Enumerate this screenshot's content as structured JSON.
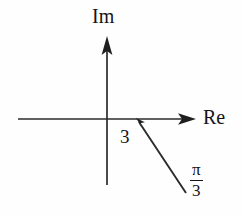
{
  "figure": {
    "kind": "complex-plane-phasor-diagram",
    "background_color": "#fefefe",
    "stroke_color": "#2b2b2b",
    "text_color": "#141414",
    "width": 242,
    "height": 217
  },
  "axes": {
    "imaginary": {
      "label": "Im",
      "orientation": "vertical",
      "x": 107,
      "y_top": 38,
      "y_bottom": 185,
      "arrow_at": "top"
    },
    "real": {
      "label": "Re",
      "orientation": "horizontal",
      "y": 119,
      "x_left": 18,
      "x_right": 196,
      "arrow_at": "right"
    },
    "origin": {
      "x": 107,
      "y": 119
    }
  },
  "vector": {
    "magnitude_label": "3",
    "angle_label_numerator": "π",
    "angle_label_denominator": "3",
    "angle_value_radians": -1.0472,
    "angle_degrees": -60,
    "direction": "below-real-axis-pointing-down-right",
    "tip_arrow_at": "origin-side",
    "start": {
      "x": 137,
      "y": 120
    },
    "end": {
      "x": 186,
      "y": 193
    }
  },
  "labels": {
    "im": "Im",
    "re": "Re",
    "magnitude": "3",
    "angle_numerator": "π",
    "angle_denominator": "3"
  }
}
